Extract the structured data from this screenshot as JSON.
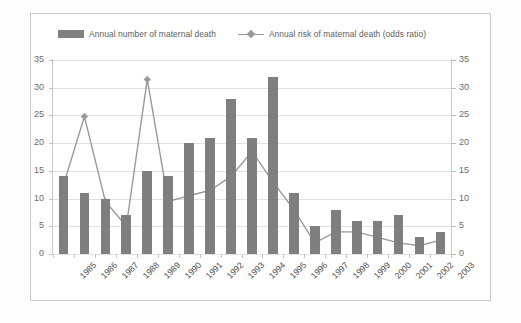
{
  "legend": {
    "items": [
      {
        "label": "Annual number of maternal death",
        "marker": "bar-swatch",
        "color": "#7f7f7f"
      },
      {
        "label": "Annual risk of maternal death (odds ratio)",
        "marker": "line-diamond",
        "color": "#9a9a9a"
      }
    ]
  },
  "axes": {
    "left_ticks": [
      "35",
      "30",
      "25",
      "20",
      "15",
      "10",
      "5",
      "0"
    ],
    "right_ticks": [
      "35",
      "30",
      "25",
      "20",
      "15",
      "10",
      "5",
      "0"
    ]
  },
  "chart_data": {
    "type": "bar",
    "title": "",
    "subtitle": "",
    "xlabel": "",
    "ylabel": "",
    "y2label": "",
    "grid": true,
    "legend_position": "top",
    "ylim": [
      0,
      35
    ],
    "y2lim": [
      0,
      35
    ],
    "ytick_step": 5,
    "categories": [
      "1985",
      "1986",
      "1987",
      "1988",
      "1989",
      "1990",
      "1991",
      "1992",
      "1993",
      "1994",
      "1995",
      "1996",
      "1997",
      "1998",
      "1999",
      "2000",
      "2001",
      "2002",
      "2003"
    ],
    "series": [
      {
        "name": "Annual number of maternal death",
        "type": "bar",
        "axis": "left",
        "color": "#7f7f7f",
        "values": [
          14,
          11,
          10,
          7,
          15,
          14,
          20,
          21,
          28,
          21,
          32,
          11,
          5,
          8,
          6,
          6,
          7,
          3,
          4
        ]
      },
      {
        "name": "Annual risk of maternal death (odds ratio)",
        "type": "line",
        "axis": "right",
        "color": "#9a9a9a",
        "marker": "diamond",
        "values": [
          12.5,
          24.8,
          9.5,
          5.0,
          31.5,
          9.5,
          10.5,
          11.5,
          14.0,
          18.5,
          13.0,
          8.0,
          2.0,
          4.0,
          4.0,
          3.0,
          2.0,
          1.5,
          2.5
        ]
      }
    ]
  }
}
